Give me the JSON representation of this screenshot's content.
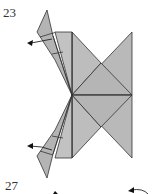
{
  "diagram": {
    "type": "origami-instructions",
    "steps": [
      {
        "number": "23",
        "description": "Fold flaps outward (arrows pointing left)"
      },
      {
        "number": "27",
        "description": "Next step (partially visible)"
      }
    ],
    "colors": {
      "paper": "#b4b4b4",
      "paper_light": "#c4c4c4",
      "line": "#333333",
      "background": "#ffffff"
    }
  }
}
